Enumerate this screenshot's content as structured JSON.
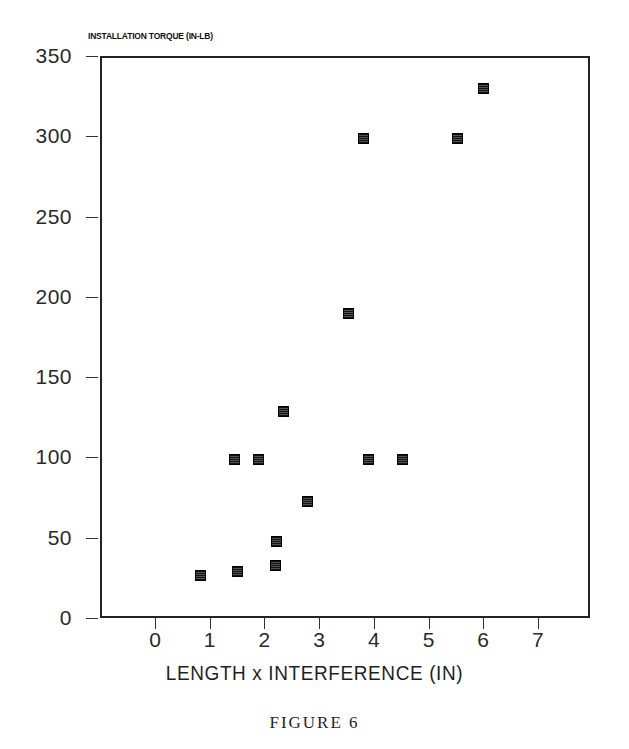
{
  "figure": {
    "caption": "FIGURE 6"
  },
  "chart_data": {
    "type": "scatter",
    "title": "",
    "xlabel": "LENGTH x INTERFERENCE (IN)",
    "ylabel": "INSTALLATION TORQUE (IN-LB)",
    "xlim": [
      -0.85,
      8.0
    ],
    "ylim": [
      0,
      350
    ],
    "xticks": [
      0,
      1,
      2,
      3,
      4,
      5,
      6,
      7
    ],
    "xtick_labels": [
      "0",
      "1",
      "2",
      "3",
      "4",
      "5",
      "6",
      "7"
    ],
    "yticks": [
      0,
      50,
      100,
      150,
      200,
      250,
      300,
      350
    ],
    "ytick_labels": [
      "0",
      "50",
      "100",
      "150",
      "200",
      "250",
      "300",
      "350"
    ],
    "grid": false,
    "legend": null,
    "marker": "filled-square",
    "marker_color": "#1a1a1a",
    "points": [
      {
        "x": 0.79,
        "y": 28
      },
      {
        "x": 1.48,
        "y": 30
      },
      {
        "x": 1.41,
        "y": 100
      },
      {
        "x": 1.85,
        "y": 100
      },
      {
        "x": 2.16,
        "y": 34
      },
      {
        "x": 2.18,
        "y": 49
      },
      {
        "x": 2.32,
        "y": 130
      },
      {
        "x": 2.76,
        "y": 74
      },
      {
        "x": 3.5,
        "y": 191
      },
      {
        "x": 3.78,
        "y": 300
      },
      {
        "x": 3.86,
        "y": 100
      },
      {
        "x": 4.48,
        "y": 100
      },
      {
        "x": 5.5,
        "y": 300
      },
      {
        "x": 5.96,
        "y": 331
      }
    ]
  }
}
